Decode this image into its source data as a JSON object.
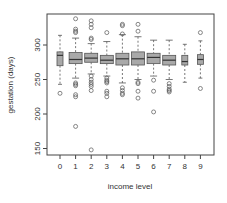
{
  "chart_data": {
    "type": "box",
    "title": "",
    "xlabel": "income level",
    "ylabel": "gestation (days)",
    "ylim": [
      143,
      346
    ],
    "yticks": [
      150,
      200,
      250,
      300
    ],
    "categories": [
      "0",
      "1",
      "2",
      "3",
      "4",
      "5",
      "6",
      "7",
      "8",
      "9"
    ],
    "box_fill": "#a9a9a9",
    "narrow_categories": [
      "0",
      "8",
      "9"
    ],
    "boxes": [
      {
        "label": "0",
        "lw": 243,
        "q1": 270,
        "med": 285,
        "q3": 290,
        "uw": 314,
        "outliers": [
          230
        ]
      },
      {
        "label": "1",
        "lw": 252,
        "q1": 273,
        "med": 279,
        "q3": 289,
        "uw": 310,
        "outliers": [
          245,
          243,
          241,
          228,
          225,
          182,
          318,
          320,
          323,
          338
        ]
      },
      {
        "label": "2",
        "lw": 258,
        "q1": 275,
        "med": 281,
        "q3": 288,
        "uw": 302,
        "outliers": [
          255,
          250,
          246,
          243,
          240,
          234,
          148,
          308,
          310,
          325,
          330,
          335
        ]
      },
      {
        "label": "3",
        "lw": 255,
        "q1": 273,
        "med": 278,
        "q3": 285,
        "uw": 305,
        "outliers": [
          252,
          249,
          247,
          245,
          233,
          230,
          225,
          318
        ]
      },
      {
        "label": "4",
        "lw": 245,
        "q1": 271,
        "med": 280,
        "q3": 288,
        "uw": 315,
        "outliers": [
          238,
          234,
          230,
          228,
          316,
          328,
          330
        ]
      },
      {
        "label": "5",
        "lw": 250,
        "q1": 271,
        "med": 280,
        "q3": 290,
        "uw": 312,
        "outliers": [
          246,
          244,
          233,
          223,
          320,
          330
        ]
      },
      {
        "label": "6",
        "lw": 255,
        "q1": 273,
        "med": 282,
        "q3": 288,
        "uw": 307,
        "outliers": [
          249,
          233,
          203
        ]
      },
      {
        "label": "7",
        "lw": 250,
        "q1": 271,
        "med": 278,
        "q3": 285,
        "uw": 307,
        "outliers": [
          244,
          240,
          236,
          234,
          232
        ]
      },
      {
        "label": "8",
        "lw": 246,
        "q1": 271,
        "med": 276,
        "q3": 285,
        "uw": 301,
        "outliers": []
      },
      {
        "label": "9",
        "lw": 252,
        "q1": 272,
        "med": 279,
        "q3": 286,
        "uw": 306,
        "outliers": [
          318,
          237
        ]
      }
    ]
  }
}
